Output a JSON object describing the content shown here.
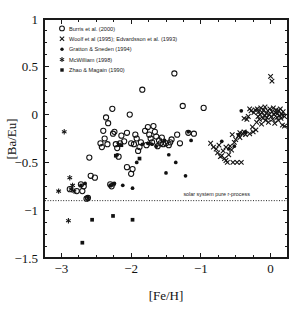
{
  "chart_data": {
    "type": "scatter",
    "title": "",
    "xlabel": "[Fe/H]",
    "ylabel": "[Ba/Eu]",
    "xlim": [
      -3.25,
      0.25
    ],
    "ylim": [
      -1.5,
      1.0
    ],
    "xticks": [
      -3,
      -2,
      -1,
      0
    ],
    "xticklabels": [
      "−3",
      "−2",
      "−1",
      "0"
    ],
    "yticks": [
      -1.5,
      -1,
      -0.5,
      0,
      0.5,
      1
    ],
    "yticklabels": [
      "−1.5",
      "−1",
      "−0.5",
      "0",
      "0.5",
      "1"
    ],
    "xminorticks": [
      -3.0,
      -2.75,
      -2.5,
      -2.25,
      -2.0,
      -1.75,
      -1.5,
      -1.25,
      -1.0,
      -0.75,
      -0.5,
      -0.25,
      0.0
    ],
    "yminorticks": [
      -1.375,
      -1.25,
      -1.125,
      -0.875,
      -0.75,
      -0.625,
      -0.375,
      -0.25,
      -0.125,
      0.125,
      0.25,
      0.375,
      0.625,
      0.75,
      0.875
    ],
    "grid": false,
    "legend_position": "upper left",
    "annotations": [
      {
        "text": "solar system pure r-process",
        "x": -1.25,
        "y": -0.855,
        "anchor": "start"
      }
    ],
    "reference_lines": [
      {
        "name": "solar-system-pure-r-process",
        "orientation": "horizontal",
        "y": -0.9,
        "style": "dotted"
      }
    ],
    "series": [
      {
        "name": "Burris et al. (2000)",
        "marker": "open-circle",
        "points": [
          [
            -2.72,
            -0.73
          ],
          [
            -2.7,
            -0.8
          ],
          [
            -2.68,
            -0.75
          ],
          [
            -2.64,
            -0.88
          ],
          [
            -2.6,
            -0.45
          ],
          [
            -2.58,
            -0.64
          ],
          [
            -2.52,
            -0.66
          ],
          [
            -2.4,
            -0.17
          ],
          [
            -2.36,
            -0.03
          ],
          [
            -2.33,
            -0.09
          ],
          [
            -2.3,
            -0.73
          ],
          [
            -2.28,
            -0.75
          ],
          [
            -2.27,
            0.06
          ],
          [
            -2.26,
            -0.2
          ],
          [
            -2.24,
            -0.18
          ],
          [
            -2.22,
            -0.31
          ],
          [
            -2.2,
            -0.35
          ],
          [
            -2.18,
            -0.44
          ],
          [
            -2.14,
            -0.22
          ],
          [
            -2.1,
            -0.28
          ],
          [
            -2.06,
            -0.19
          ],
          [
            -2.02,
            0.0
          ],
          [
            -2.0,
            -0.3
          ],
          [
            -1.98,
            -0.57
          ],
          [
            -1.96,
            -0.31
          ],
          [
            -1.94,
            -0.21
          ],
          [
            -1.92,
            -0.25
          ],
          [
            -1.9,
            -0.38
          ],
          [
            -1.88,
            -0.34
          ],
          [
            -1.86,
            -0.29
          ],
          [
            -1.84,
            0.26
          ],
          [
            -1.8,
            -0.17
          ],
          [
            -1.76,
            -0.13
          ],
          [
            -1.74,
            -0.21
          ],
          [
            -1.72,
            -0.25
          ],
          [
            -1.7,
            -0.29
          ],
          [
            -1.68,
            -0.12
          ],
          [
            -1.66,
            -0.18
          ],
          [
            -1.64,
            -0.23
          ],
          [
            -1.62,
            -0.33
          ],
          [
            -1.58,
            -0.3
          ],
          [
            -1.54,
            -0.31
          ],
          [
            -1.5,
            -0.3
          ],
          [
            -1.46,
            -0.32
          ],
          [
            -1.42,
            -0.26
          ],
          [
            -1.38,
            0.43
          ],
          [
            -1.34,
            -0.21
          ],
          [
            -1.26,
            0.09
          ],
          [
            -1.18,
            -0.19
          ],
          [
            -1.1,
            -0.2
          ],
          [
            -0.96,
            0.07
          ],
          [
            -2.44,
            -0.3
          ],
          [
            -2.42,
            -0.34
          ],
          [
            -2.38,
            -0.25
          ],
          [
            -2.34,
            -0.31
          ],
          [
            -1.6,
            -0.27
          ],
          [
            -2.06,
            -0.55
          ],
          [
            -2.0,
            -0.62
          ],
          [
            -2.88,
            -0.78
          ],
          [
            -1.78,
            -0.32
          ],
          [
            -1.56,
            -0.24
          ],
          [
            -2.16,
            -0.3
          ],
          [
            -1.44,
            -0.29
          ],
          [
            -2.62,
            -0.87
          ],
          [
            -1.3,
            -0.3
          ],
          [
            -2.78,
            -0.8
          ]
        ]
      },
      {
        "name": "Woolf et al (1995); Edvardsson et al. (1993)",
        "marker": "cross",
        "points": [
          [
            -0.86,
            -0.3
          ],
          [
            -0.82,
            -0.34
          ],
          [
            -0.78,
            -0.36
          ],
          [
            -0.76,
            -0.4
          ],
          [
            -0.74,
            -0.32
          ],
          [
            -0.72,
            -0.44
          ],
          [
            -0.7,
            -0.43
          ],
          [
            -0.68,
            -0.38
          ],
          [
            -0.66,
            -0.46
          ],
          [
            -0.64,
            -0.48
          ],
          [
            -0.62,
            -0.5
          ],
          [
            -0.6,
            -0.42
          ],
          [
            -0.58,
            -0.33
          ],
          [
            -0.56,
            -0.37
          ],
          [
            -0.54,
            -0.5
          ],
          [
            -0.52,
            -0.29
          ],
          [
            -0.5,
            -0.26
          ],
          [
            -0.48,
            -0.5
          ],
          [
            -0.46,
            -0.22
          ],
          [
            -0.44,
            -0.24
          ],
          [
            -0.42,
            -0.5
          ],
          [
            -0.4,
            -0.2
          ],
          [
            -0.38,
            -0.18
          ],
          [
            -0.36,
            -0.21
          ],
          [
            -0.34,
            -0.05
          ],
          [
            -0.32,
            -0.02
          ],
          [
            -0.3,
            -0.2
          ],
          [
            -0.28,
            0.04
          ],
          [
            -0.26,
            -0.13
          ],
          [
            -0.24,
            0.02
          ],
          [
            -0.22,
            0.05
          ],
          [
            -0.2,
            -0.08
          ],
          [
            -0.19,
            0.06
          ],
          [
            -0.18,
            -0.02
          ],
          [
            -0.17,
            0.03
          ],
          [
            -0.16,
            -0.05
          ],
          [
            -0.15,
            0.0
          ],
          [
            -0.14,
            0.07
          ],
          [
            -0.13,
            -0.1
          ],
          [
            -0.12,
            0.02
          ],
          [
            -0.11,
            -0.04
          ],
          [
            -0.1,
            0.05
          ],
          [
            -0.09,
            -0.01
          ],
          [
            -0.08,
            0.08
          ],
          [
            -0.07,
            -0.06
          ],
          [
            -0.06,
            0.01
          ],
          [
            -0.05,
            -0.03
          ],
          [
            -0.04,
            0.04
          ],
          [
            -0.03,
            -0.08
          ],
          [
            -0.02,
            0.0
          ],
          [
            -0.01,
            0.06
          ],
          [
            0.0,
            0.4
          ],
          [
            0.01,
            -0.02
          ],
          [
            0.02,
            0.03
          ],
          [
            0.03,
            -0.05
          ],
          [
            0.04,
            0.07
          ],
          [
            0.05,
            0.0
          ],
          [
            0.06,
            -0.09
          ],
          [
            0.07,
            0.02
          ],
          [
            0.08,
            0.05
          ],
          [
            0.09,
            -0.03
          ],
          [
            0.1,
            0.01
          ],
          [
            0.11,
            -0.06
          ],
          [
            0.12,
            0.04
          ],
          [
            0.13,
            -0.01
          ],
          [
            0.14,
            0.06
          ],
          [
            0.15,
            -0.04
          ],
          [
            0.16,
            0.0
          ],
          [
            0.17,
            -0.11
          ],
          [
            0.18,
            0.03
          ],
          [
            0.02,
            0.35
          ],
          [
            -0.3,
            0.06
          ],
          [
            -0.44,
            -0.19
          ],
          [
            -0.38,
            -0.04
          ],
          [
            -0.55,
            -0.21
          ],
          [
            -0.64,
            -0.34
          ],
          [
            0.2,
            -0.02
          ],
          [
            0.2,
            -0.12
          ],
          [
            -0.25,
            -0.18
          ],
          [
            -0.21,
            -0.16
          ]
        ]
      },
      {
        "name": "Gratton & Sneden (1994)",
        "marker": "filled-circle",
        "points": [
          [
            -2.3,
            -0.74
          ],
          [
            -2.24,
            -0.72
          ],
          [
            -2.2,
            -0.42
          ],
          [
            -2.12,
            -0.74
          ],
          [
            -1.98,
            -0.77
          ],
          [
            -1.92,
            -0.5
          ],
          [
            -1.84,
            -0.31
          ],
          [
            -1.76,
            -0.3
          ],
          [
            -1.7,
            -0.31
          ],
          [
            -1.64,
            -0.33
          ],
          [
            -1.52,
            -0.27
          ],
          [
            -1.5,
            -0.61
          ],
          [
            -1.46,
            -0.42
          ],
          [
            -1.36,
            -0.5
          ],
          [
            -1.22,
            -0.64
          ],
          [
            -1.18,
            -0.18
          ],
          [
            -1.14,
            -0.27
          ],
          [
            -0.6,
            -0.36
          ],
          [
            -0.52,
            -0.33
          ],
          [
            -0.46,
            -0.21
          ],
          [
            -0.42,
            0.04
          ],
          [
            -0.36,
            -0.18
          ],
          [
            -2.66,
            -0.72
          ],
          [
            -2.72,
            -0.74
          ],
          [
            -2.62,
            -0.86
          ],
          [
            -0.7,
            -0.28
          ]
        ]
      },
      {
        "name": "McWilliam (1998)",
        "marker": "star",
        "points": [
          [
            -2.96,
            -0.18
          ],
          [
            -2.88,
            -0.66
          ],
          [
            -2.86,
            -0.78
          ],
          [
            -2.84,
            -0.74
          ],
          [
            -2.82,
            -0.8
          ],
          [
            -3.04,
            -0.8
          ],
          [
            -2.9,
            -1.11
          ],
          [
            -2.26,
            -0.73
          ],
          [
            -2.18,
            -0.31
          ],
          [
            -2.62,
            -0.88
          ],
          [
            -1.74,
            -0.3
          ]
        ]
      },
      {
        "name": "Zhao & Magain (1990)",
        "marker": "filled-square",
        "points": [
          [
            -2.7,
            -1.34
          ],
          [
            -2.56,
            -1.1
          ],
          [
            -2.26,
            -1.06
          ],
          [
            -1.98,
            -1.1
          ],
          [
            -2.22,
            -0.43
          ],
          [
            -2.14,
            -0.32
          ],
          [
            -1.88,
            -0.46
          ]
        ]
      }
    ]
  },
  "legend": {
    "entries": [
      {
        "marker": "open-circle",
        "label": "Burris et al. (2000)"
      },
      {
        "marker": "cross",
        "label": "Woolf et al (1995); Edvardsson et al. (1993)"
      },
      {
        "marker": "filled-circle",
        "label": "Gratton & Sneden (1994)"
      },
      {
        "marker": "star",
        "label": "McWilliam  (1998)"
      },
      {
        "marker": "filled-square",
        "label": "Zhao & Magain (1990)"
      }
    ]
  },
  "colors": {
    "ink": "#111111",
    "background": "#ffffff"
  }
}
